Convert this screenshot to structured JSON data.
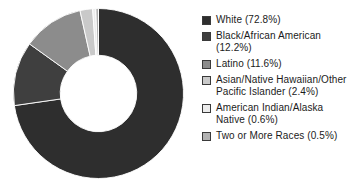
{
  "chart_data": {
    "type": "pie",
    "variant": "donut",
    "title": "",
    "subtitle": "",
    "xlabel": "",
    "ylabel": "",
    "grid": false,
    "legend_position": "right",
    "start_angle_deg": 0,
    "direction": "clockwise",
    "inner_radius_ratio": 0.45,
    "units": "percent",
    "categories": [
      "White",
      "Black/African American",
      "Latino",
      "Asian/Native Hawaiian/Other Pacific Islander",
      "American Indian/Alaska Native",
      "Two or More Races"
    ],
    "values": [
      72.8,
      12.2,
      11.6,
      2.4,
      0.6,
      0.5
    ],
    "colors": [
      "#2e2e2e",
      "#3f3f3f",
      "#8c8c8c",
      "#c9c9c9",
      "#ececec",
      "#b2b2b2"
    ],
    "slice_border_color": "#ffffff"
  },
  "legend": {
    "items": [
      {
        "label": "White (72.8%)",
        "color": "#2e2e2e",
        "name": "white"
      },
      {
        "label": "Black/African American\n(12.2%)",
        "color": "#3f3f3f",
        "name": "black-african-american"
      },
      {
        "label": "Latino (11.6%)",
        "color": "#8c8c8c",
        "name": "latino"
      },
      {
        "label": "Asian/Native Hawaiian/Other\nPacific Islander (2.4%)",
        "color": "#c9c9c9",
        "name": "asian-nhpi"
      },
      {
        "label": "American Indian/Alaska\nNative (0.6%)",
        "color": "#ececec",
        "name": "american-indian-alaska-native"
      },
      {
        "label": "Two or More Races (0.5%)",
        "color": "#b2b2b2",
        "name": "two-or-more-races"
      }
    ]
  }
}
